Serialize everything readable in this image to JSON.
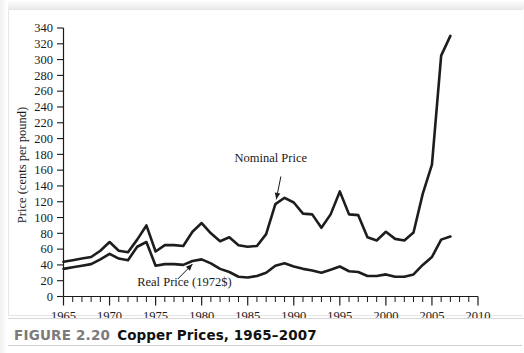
{
  "figure": {
    "label": "FIGURE 2.20",
    "title": "Copper Prices, 1965–2007"
  },
  "chart_data": {
    "type": "line",
    "title": "Copper Prices, 1965–2007",
    "xlabel": "",
    "ylabel": "Price (cents per pound)",
    "xlim": [
      1965,
      2010
    ],
    "ylim": [
      0,
      340
    ],
    "ytick_step": 20,
    "yticks": [
      0,
      20,
      40,
      60,
      80,
      100,
      120,
      140,
      160,
      180,
      200,
      220,
      240,
      260,
      280,
      300,
      320,
      340
    ],
    "xticks_major": [
      1965,
      1970,
      1975,
      1980,
      1985,
      1990,
      1995,
      2000,
      2005,
      2010
    ],
    "xtick_minor_step": 1,
    "grid": false,
    "legend": "none",
    "x": [
      1965,
      1966,
      1967,
      1968,
      1969,
      1970,
      1971,
      1972,
      1973,
      1974,
      1975,
      1976,
      1977,
      1978,
      1979,
      1980,
      1981,
      1982,
      1983,
      1984,
      1985,
      1986,
      1987,
      1988,
      1989,
      1990,
      1991,
      1992,
      1993,
      1994,
      1995,
      1996,
      1997,
      1998,
      1999,
      2000,
      2001,
      2002,
      2003,
      2004,
      2005,
      2006,
      2007
    ],
    "series": [
      {
        "name": "Nominal Price",
        "annotation": "Nominal Price",
        "values": [
          44,
          46,
          48,
          50,
          58,
          69,
          58,
          56,
          72,
          90,
          57,
          65,
          65,
          64,
          82,
          93,
          80,
          70,
          75,
          65,
          63,
          64,
          79,
          117,
          125,
          119,
          105,
          104,
          87,
          104,
          133,
          104,
          103,
          75,
          71,
          82,
          73,
          71,
          81,
          130,
          167,
          305,
          330
        ]
      },
      {
        "name": "Real Price (1972$)",
        "annotation": "Real Price (1972$)",
        "values": [
          35,
          37,
          39,
          41,
          47,
          54,
          48,
          46,
          63,
          69,
          39,
          41,
          41,
          40,
          45,
          47,
          42,
          35,
          31,
          25,
          24,
          26,
          30,
          39,
          42,
          38,
          35,
          33,
          30,
          34,
          38,
          32,
          31,
          26,
          26,
          28,
          25,
          25,
          28,
          40,
          50,
          72,
          76
        ]
      }
    ],
    "annotations": [
      {
        "text": "Nominal Price",
        "x_label": 1987.5,
        "y_label": 170
      },
      {
        "text": "Real Price (1972$)",
        "x_label": 1973,
        "y_label": 13
      }
    ]
  }
}
